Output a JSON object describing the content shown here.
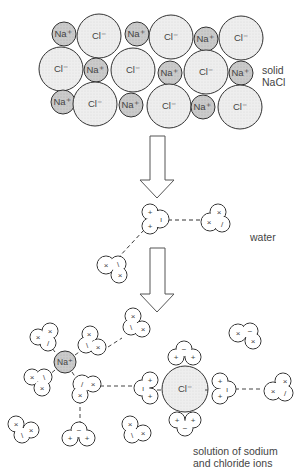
{
  "diagram": {
    "stages": [
      {
        "id": "solid",
        "label_line1": "solid",
        "label_line2": "NaCl"
      },
      {
        "id": "water",
        "label": "water"
      },
      {
        "id": "solution",
        "label_line1": "solution of sodium",
        "label_line2": "and chloride ions"
      }
    ],
    "ion_labels": {
      "sodium": "Na+",
      "chloride": "Cl−"
    },
    "lattice": {
      "rows": [
        [
          "Na+",
          "Cl-",
          "Na+",
          "Cl-",
          "Na+",
          "Cl-"
        ],
        [
          "Cl-",
          "Na+",
          "Cl-",
          "Na+",
          "Cl-",
          "Na+"
        ],
        [
          "Na+",
          "Cl-",
          "Na+",
          "Cl-",
          "Na+",
          "Cl-"
        ]
      ]
    },
    "colors": {
      "sodium_fill": "#c8c8c8",
      "chloride_fill": "#ececec",
      "outline": "#333333",
      "text": "#444444"
    },
    "arrows": [
      "down-arrow-1",
      "down-arrow-2"
    ]
  }
}
